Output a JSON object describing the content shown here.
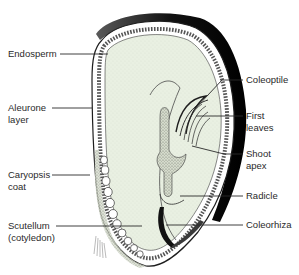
{
  "colors": {
    "endosperm_fill": "#e9f0e2",
    "outline": "#1e1e1e",
    "label_text": "#2a2a2a",
    "background": "#ffffff"
  },
  "labels": {
    "left": [
      {
        "id": "endosperm",
        "text": "Endosperm"
      },
      {
        "id": "aleurone",
        "text": "Aleurone\nlayer"
      },
      {
        "id": "caryopsis_coat",
        "text": "Caryopsis\ncoat"
      },
      {
        "id": "scutellum",
        "text": "Scutellum\n(cotyledon)"
      }
    ],
    "right": [
      {
        "id": "coleoptile",
        "text": "Coleoptile"
      },
      {
        "id": "first_leaves",
        "text": "First\nleaves"
      },
      {
        "id": "shoot_apex",
        "text": "Shoot\napex"
      },
      {
        "id": "radicle",
        "text": "Radicle"
      },
      {
        "id": "coleorhiza",
        "text": "Coleorhiza"
      }
    ]
  }
}
